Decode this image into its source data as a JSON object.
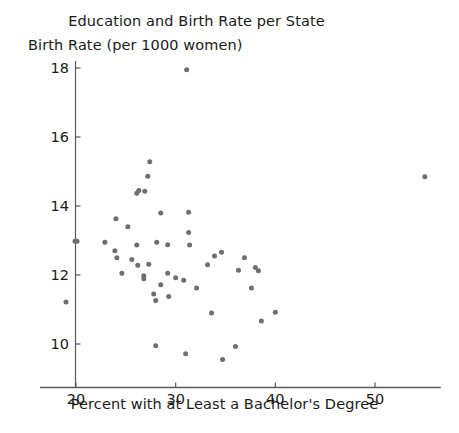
{
  "chart_data": {
    "type": "scatter",
    "title": "Education and Birth Rate per State",
    "xlabel": "Percent with at Least a Bachelor's Degree",
    "ylabel": "Birth Rate (per 1000 women)",
    "xlim": [
      17.6,
      56.6
    ],
    "ylim": [
      9.1,
      18.2
    ],
    "xticks": [
      20,
      30,
      40,
      50
    ],
    "yticks": [
      10,
      12,
      14,
      16,
      18
    ],
    "xtick_labels": [
      "20",
      "30",
      "40",
      "50"
    ],
    "ytick_labels": [
      "10",
      "12",
      "14",
      "16",
      "18"
    ],
    "grid": false,
    "legend": null,
    "marker_color": "#6e6e70",
    "marker_size": 5,
    "axis_color": "#595959",
    "n_points": 51,
    "points": [
      [
        31.1,
        17.95
      ],
      [
        27.4,
        15.28
      ],
      [
        26.3,
        14.45
      ],
      [
        26.9,
        14.43
      ],
      [
        26.1,
        14.37
      ],
      [
        27.2,
        14.86
      ],
      [
        55.0,
        14.85
      ],
      [
        24.0,
        13.63
      ],
      [
        28.5,
        13.8
      ],
      [
        31.3,
        13.82
      ],
      [
        25.2,
        13.4
      ],
      [
        31.3,
        13.23
      ],
      [
        19.9,
        12.98
      ],
      [
        20.1,
        12.98
      ],
      [
        22.9,
        12.95
      ],
      [
        23.9,
        12.7
      ],
      [
        26.1,
        12.87
      ],
      [
        28.1,
        12.95
      ],
      [
        29.2,
        12.88
      ],
      [
        31.4,
        12.87
      ],
      [
        24.1,
        12.5
      ],
      [
        25.6,
        12.45
      ],
      [
        33.9,
        12.55
      ],
      [
        34.6,
        12.66
      ],
      [
        36.9,
        12.5
      ],
      [
        26.2,
        12.28
      ],
      [
        27.3,
        12.31
      ],
      [
        33.2,
        12.3
      ],
      [
        38.0,
        12.22
      ],
      [
        38.3,
        12.12
      ],
      [
        24.6,
        12.05
      ],
      [
        26.8,
        11.98
      ],
      [
        26.8,
        11.89
      ],
      [
        29.2,
        12.05
      ],
      [
        30.0,
        11.92
      ],
      [
        36.3,
        12.14
      ],
      [
        30.8,
        11.85
      ],
      [
        28.5,
        11.72
      ],
      [
        37.6,
        11.62
      ],
      [
        27.8,
        11.45
      ],
      [
        32.1,
        11.62
      ],
      [
        19.0,
        11.22
      ],
      [
        29.3,
        11.38
      ],
      [
        28.0,
        11.26
      ],
      [
        40.0,
        10.92
      ],
      [
        33.6,
        10.9
      ],
      [
        38.6,
        10.67
      ],
      [
        31.0,
        9.72
      ],
      [
        28.0,
        9.95
      ],
      [
        36.0,
        9.93
      ],
      [
        34.7,
        9.55
      ]
    ]
  }
}
